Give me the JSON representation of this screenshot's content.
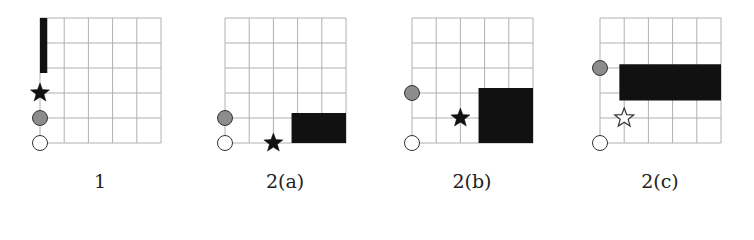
{
  "figure": {
    "grid": {
      "cols": 5,
      "rows": 5,
      "cell_w": 24.2,
      "cell_h": 25,
      "line_color": "#b0b0b0"
    },
    "colors": {
      "block": "#111111",
      "gray_marker": "#8c8c8c",
      "white_marker": "#ffffff",
      "outline": "#333333"
    },
    "panels": [
      {
        "label": "1",
        "origin_x": 40,
        "block": {
          "col0": 0,
          "row0": 0,
          "cols": 0.3,
          "rows": 2.2
        },
        "star": {
          "col": 0,
          "row": 3,
          "filled": true
        },
        "gray_marker": {
          "col": 0,
          "row": 4
        },
        "white_marker": {
          "col": 0,
          "row": 5
        }
      },
      {
        "label": "2(a)",
        "origin_x": 225,
        "block": {
          "col0": 2.75,
          "row0": 3.8,
          "cols": 2.25,
          "rows": 1.2
        },
        "star": {
          "col": 2,
          "row": 5,
          "filled": true
        },
        "gray_marker": {
          "col": 0,
          "row": 4
        },
        "white_marker": {
          "col": 0,
          "row": 5
        }
      },
      {
        "label": "2(b)",
        "origin_x": 412,
        "block": {
          "col0": 2.75,
          "row0": 2.8,
          "cols": 2.25,
          "rows": 2.2
        },
        "star": {
          "col": 2,
          "row": 4,
          "filled": true
        },
        "gray_marker": {
          "col": 0,
          "row": 3
        },
        "white_marker": {
          "col": 0,
          "row": 5
        }
      },
      {
        "label": "2(c)",
        "origin_x": 600,
        "block": {
          "col0": 0.8,
          "row0": 1.85,
          "cols": 4.2,
          "rows": 1.45
        },
        "star": {
          "col": 1,
          "row": 4,
          "filled": false
        },
        "gray_marker": {
          "col": 0,
          "row": 2
        },
        "white_marker": {
          "col": 0,
          "row": 5
        }
      }
    ]
  }
}
